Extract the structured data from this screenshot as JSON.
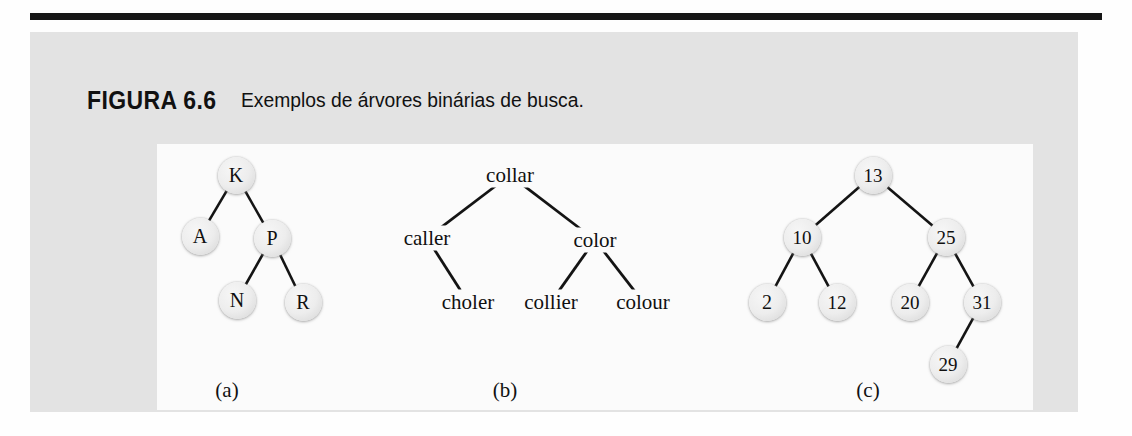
{
  "figure": {
    "label": "FIGURA 6.6",
    "title": "Exemplos de árvores binárias de busca.",
    "rule_color": "#161616",
    "panel_color": "#e3e3e3",
    "diagram_color": "#fbfbfb",
    "node_color": "#ededed"
  },
  "subcaptions": [
    {
      "text": "(a)",
      "x": 70,
      "y": 246
    },
    {
      "text": "(b)",
      "x": 348,
      "y": 246
    },
    {
      "text": "(c)",
      "x": 711,
      "y": 246
    }
  ],
  "trees": {
    "a": {
      "caption": "(a)",
      "style": "circle",
      "nodes": [
        {
          "id": "K",
          "label": "K",
          "x": 79,
          "y": 31
        },
        {
          "id": "A",
          "label": "A",
          "x": 43,
          "y": 92
        },
        {
          "id": "P",
          "label": "P",
          "x": 115,
          "y": 94
        },
        {
          "id": "N",
          "label": "N",
          "x": 80,
          "y": 156
        },
        {
          "id": "R",
          "label": "R",
          "x": 146,
          "y": 158
        }
      ],
      "edges": [
        {
          "from": "K",
          "to": "A"
        },
        {
          "from": "K",
          "to": "P"
        },
        {
          "from": "P",
          "to": "N"
        },
        {
          "from": "P",
          "to": "R"
        }
      ]
    },
    "b": {
      "caption": "(b)",
      "style": "text",
      "nodes": [
        {
          "id": "collar",
          "label": "collar",
          "x": 353,
          "y": 31
        },
        {
          "id": "caller",
          "label": "caller",
          "x": 270,
          "y": 94
        },
        {
          "id": "color",
          "label": "color",
          "x": 438,
          "y": 96
        },
        {
          "id": "choler",
          "label": "choler",
          "x": 311,
          "y": 158
        },
        {
          "id": "collier",
          "label": "collier",
          "x": 394,
          "y": 158
        },
        {
          "id": "colour",
          "label": "colour",
          "x": 486,
          "y": 158
        }
      ],
      "edges": [
        {
          "from": "collar",
          "to": "caller"
        },
        {
          "from": "collar",
          "to": "color"
        },
        {
          "from": "caller",
          "to": "choler"
        },
        {
          "from": "color",
          "to": "collier"
        },
        {
          "from": "color",
          "to": "colour"
        }
      ]
    },
    "c": {
      "caption": "(c)",
      "style": "circle",
      "nodes": [
        {
          "id": "13",
          "label": "13",
          "x": 716,
          "y": 31
        },
        {
          "id": "10",
          "label": "10",
          "x": 645,
          "y": 93
        },
        {
          "id": "25",
          "label": "25",
          "x": 789,
          "y": 93
        },
        {
          "id": "2",
          "label": "2",
          "x": 610,
          "y": 158
        },
        {
          "id": "12",
          "label": "12",
          "x": 680,
          "y": 158
        },
        {
          "id": "20",
          "label": "20",
          "x": 753,
          "y": 158
        },
        {
          "id": "31",
          "label": "31",
          "x": 825,
          "y": 158
        },
        {
          "id": "29",
          "label": "29",
          "x": 791,
          "y": 220
        }
      ],
      "edges": [
        {
          "from": "13",
          "to": "10"
        },
        {
          "from": "13",
          "to": "25"
        },
        {
          "from": "10",
          "to": "2"
        },
        {
          "from": "10",
          "to": "12"
        },
        {
          "from": "25",
          "to": "20"
        },
        {
          "from": "25",
          "to": "31"
        },
        {
          "from": "31",
          "to": "29"
        }
      ]
    }
  }
}
